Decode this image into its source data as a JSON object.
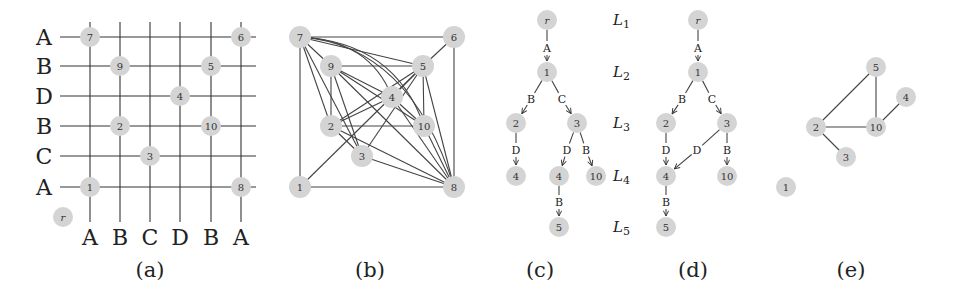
{
  "figure": {
    "node_color": "#d4d4d4",
    "line_color": "#333333",
    "captions": [
      {
        "id": "a",
        "text": "(a)",
        "x": 150,
        "y": 270
      },
      {
        "id": "b",
        "text": "(b)",
        "x": 370,
        "y": 270
      },
      {
        "id": "c",
        "text": "(c)",
        "x": 540,
        "y": 270
      },
      {
        "id": "d",
        "text": "(d)",
        "x": 693,
        "y": 270
      },
      {
        "id": "e",
        "text": "(e)",
        "x": 851,
        "y": 270
      }
    ]
  },
  "panel_a": {
    "row_labels": [
      "A",
      "B",
      "D",
      "B",
      "C",
      "A"
    ],
    "row_y": [
      37,
      66,
      96,
      126,
      156,
      187
    ],
    "col_labels": [
      "A",
      "B",
      "C",
      "D",
      "B",
      "A"
    ],
    "col_x": [
      90,
      120,
      150,
      180,
      211,
      241
    ],
    "nodes": [
      {
        "label": "7",
        "x": 90,
        "y": 37
      },
      {
        "label": "6",
        "x": 241,
        "y": 37
      },
      {
        "label": "9",
        "x": 120,
        "y": 66
      },
      {
        "label": "5",
        "x": 211,
        "y": 66
      },
      {
        "label": "4",
        "x": 180,
        "y": 96
      },
      {
        "label": "2",
        "x": 120,
        "y": 126
      },
      {
        "label": "10",
        "x": 211,
        "y": 126
      },
      {
        "label": "3",
        "x": 150,
        "y": 156
      },
      {
        "label": "1",
        "x": 90,
        "y": 187
      },
      {
        "label": "8",
        "x": 241,
        "y": 187
      },
      {
        "label": "r",
        "x": 63,
        "y": 217
      }
    ]
  },
  "panel_b": {
    "nodes": [
      {
        "label": "7",
        "x": 300,
        "y": 37
      },
      {
        "label": "6",
        "x": 454,
        "y": 37
      },
      {
        "label": "9",
        "x": 331,
        "y": 66
      },
      {
        "label": "5",
        "x": 423,
        "y": 66
      },
      {
        "label": "4",
        "x": 392,
        "y": 97
      },
      {
        "label": "2",
        "x": 331,
        "y": 126
      },
      {
        "label": "10",
        "x": 424,
        "y": 126
      },
      {
        "label": "3",
        "x": 362,
        "y": 156
      },
      {
        "label": "1",
        "x": 300,
        "y": 187
      },
      {
        "label": "8",
        "x": 454,
        "y": 187
      }
    ],
    "edges": [
      [
        "7",
        "6"
      ],
      [
        "7",
        "1"
      ],
      [
        "6",
        "8"
      ],
      [
        "1",
        "8"
      ],
      [
        "6",
        "5"
      ],
      [
        "7",
        "9"
      ],
      [
        "7",
        "5"
      ],
      [
        "7",
        "2"
      ],
      [
        "7",
        "3"
      ],
      [
        "9",
        "5"
      ],
      [
        "9",
        "2"
      ],
      [
        "9",
        "4"
      ],
      [
        "9",
        "10"
      ],
      [
        "9",
        "8"
      ],
      [
        "9",
        "3"
      ],
      [
        "5",
        "4"
      ],
      [
        "5",
        "2"
      ],
      [
        "5",
        "3"
      ],
      [
        "5",
        "1"
      ],
      [
        "5",
        "10"
      ],
      [
        "5",
        "8"
      ],
      [
        "4",
        "10"
      ],
      [
        "4",
        "8"
      ],
      [
        "4",
        "2"
      ],
      [
        "2",
        "10"
      ],
      [
        "2",
        "3"
      ],
      [
        "2",
        "8"
      ],
      [
        "3",
        "8"
      ],
      [
        "10",
        "8"
      ]
    ],
    "curved_edges": [
      {
        "from": "7",
        "to": "4",
        "cx": 370,
        "cy": 40
      },
      {
        "from": "7",
        "to": "10",
        "cx": 395,
        "cy": 42
      },
      {
        "from": "7",
        "to": "8",
        "cx": 410,
        "cy": 45
      }
    ]
  },
  "panel_c": {
    "nodes": [
      {
        "id": "r",
        "label": "r",
        "x": 547,
        "y": 20
      },
      {
        "id": "1",
        "label": "1",
        "x": 547,
        "y": 72
      },
      {
        "id": "2",
        "label": "2",
        "x": 516,
        "y": 123
      },
      {
        "id": "3",
        "label": "3",
        "x": 577,
        "y": 123
      },
      {
        "id": "4a",
        "label": "4",
        "x": 516,
        "y": 176
      },
      {
        "id": "4b",
        "label": "4",
        "x": 559,
        "y": 176
      },
      {
        "id": "10",
        "label": "10",
        "x": 596,
        "y": 176
      },
      {
        "id": "5",
        "label": "5",
        "x": 559,
        "y": 227
      }
    ],
    "edges": [
      {
        "from": "r",
        "to": "1",
        "letter": "A",
        "lx": 547,
        "ly": 48
      },
      {
        "from": "1",
        "to": "2",
        "letter": "B",
        "lx": 531,
        "ly": 99
      },
      {
        "from": "1",
        "to": "3",
        "letter": "C",
        "lx": 562,
        "ly": 99
      },
      {
        "from": "2",
        "to": "4a",
        "letter": "D",
        "lx": 516,
        "ly": 150
      },
      {
        "from": "3",
        "to": "4b",
        "letter": "D",
        "lx": 567,
        "ly": 150
      },
      {
        "from": "3",
        "to": "10",
        "letter": "B",
        "lx": 586,
        "ly": 150
      },
      {
        "from": "4b",
        "to": "5",
        "letter": "B",
        "lx": 559,
        "ly": 202
      }
    ],
    "levels": [
      {
        "main": "L",
        "sub": "1",
        "x": 613,
        "y": 20
      },
      {
        "main": "L",
        "sub": "2",
        "x": 613,
        "y": 72
      },
      {
        "main": "L",
        "sub": "3",
        "x": 613,
        "y": 123
      },
      {
        "main": "L",
        "sub": "4",
        "x": 613,
        "y": 176
      },
      {
        "main": "L",
        "sub": "5",
        "x": 613,
        "y": 227
      }
    ]
  },
  "panel_d": {
    "nodes": [
      {
        "id": "r",
        "label": "r",
        "x": 698,
        "y": 20
      },
      {
        "id": "1",
        "label": "1",
        "x": 698,
        "y": 72
      },
      {
        "id": "2",
        "label": "2",
        "x": 666,
        "y": 123
      },
      {
        "id": "3",
        "label": "3",
        "x": 727,
        "y": 123
      },
      {
        "id": "4",
        "label": "4",
        "x": 666,
        "y": 176
      },
      {
        "id": "10",
        "label": "10",
        "x": 727,
        "y": 176
      },
      {
        "id": "5",
        "label": "5",
        "x": 666,
        "y": 227
      }
    ],
    "edges": [
      {
        "from": "r",
        "to": "1",
        "letter": "A",
        "lx": 698,
        "ly": 48
      },
      {
        "from": "1",
        "to": "2",
        "letter": "B",
        "lx": 682,
        "ly": 99
      },
      {
        "from": "1",
        "to": "3",
        "letter": "C",
        "lx": 712,
        "ly": 99
      },
      {
        "from": "2",
        "to": "4",
        "letter": "D",
        "lx": 666,
        "ly": 150
      },
      {
        "from": "3",
        "to": "4",
        "letter": "D",
        "lx": 697,
        "ly": 150
      },
      {
        "from": "3",
        "to": "10",
        "letter": "B",
        "lx": 727,
        "ly": 150
      },
      {
        "from": "4",
        "to": "5",
        "letter": "B",
        "lx": 666,
        "ly": 202
      }
    ]
  },
  "panel_e": {
    "nodes": [
      {
        "label": "5",
        "x": 876,
        "y": 67
      },
      {
        "label": "4",
        "x": 906,
        "y": 97
      },
      {
        "label": "2",
        "x": 816,
        "y": 127
      },
      {
        "label": "10",
        "x": 876,
        "y": 127
      },
      {
        "label": "3",
        "x": 846,
        "y": 157
      },
      {
        "label": "1",
        "x": 786,
        "y": 187
      }
    ],
    "edges": [
      [
        "5",
        "2"
      ],
      [
        "5",
        "10"
      ],
      [
        "2",
        "10"
      ],
      [
        "10",
        "4"
      ],
      [
        "2",
        "3"
      ]
    ]
  }
}
